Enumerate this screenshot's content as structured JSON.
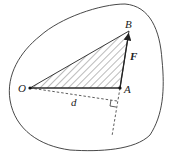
{
  "diagram": {
    "type": "physics-moment-of-force",
    "labels": {
      "origin": "O",
      "point_a": "A",
      "point_b": "B",
      "force": "F",
      "distance": "d"
    },
    "points": {
      "O": [
        30,
        88
      ],
      "A": [
        120,
        88
      ],
      "B": [
        129,
        31
      ],
      "perp_foot": [
        117,
        101
      ],
      "dashed_end": [
        112,
        136
      ]
    },
    "colors": {
      "stroke": "#333333",
      "hatch": "#555555",
      "background": "#ffffff"
    }
  }
}
